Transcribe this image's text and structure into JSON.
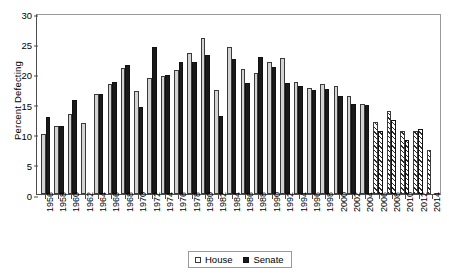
{
  "chart_data": {
    "type": "bar",
    "title": "",
    "xlabel": "",
    "ylabel": "Percent Defecting",
    "ylim": [
      0,
      30
    ],
    "yticks": [
      0,
      5,
      10,
      15,
      20,
      25,
      30
    ],
    "grid": false,
    "legend_position": "bottom-center",
    "categories": [
      "1956",
      "1958",
      "1960",
      "1962",
      "1964",
      "1966",
      "1968",
      "1970",
      "1972",
      "1974",
      "1976",
      "1978",
      "1980",
      "1982",
      "1984",
      "1986",
      "1988",
      "1990",
      "1992",
      "1994",
      "1996",
      "1998",
      "2000",
      "2002",
      "2004",
      "2006",
      "2008",
      "2010",
      "2012",
      "2014"
    ],
    "series": [
      {
        "name": "House",
        "values": [
          10.0,
          11.3,
          13.3,
          11.8,
          16.5,
          18.2,
          20.9,
          17.0,
          19.2,
          19.6,
          20.6,
          23.3,
          25.9,
          17.2,
          24.4,
          20.7,
          20.0,
          21.8,
          22.5,
          18.6,
          17.6,
          18.2,
          17.9,
          16.3,
          14.9,
          12.0,
          13.7,
          10.4,
          10.4,
          7.3
        ]
      },
      {
        "name": "Senate",
        "values": [
          12.8,
          11.2,
          15.6,
          null,
          16.6,
          18.6,
          21.4,
          14.4,
          24.4,
          19.8,
          21.9,
          21.9,
          23.1,
          12.9,
          22.3,
          18.4,
          22.7,
          21.0,
          18.4,
          17.9,
          17.2,
          17.4,
          16.2,
          15.0,
          14.8,
          10.5,
          12.3,
          9.0,
          10.8,
          null
        ]
      }
    ]
  },
  "legend": {
    "house_label": "House",
    "senate_label": "Senate"
  },
  "colors": {
    "house": "#d3d3d3",
    "senate": "#1a1a1a",
    "axis": "#4d4d4d",
    "frame": "#9a9a9a"
  }
}
